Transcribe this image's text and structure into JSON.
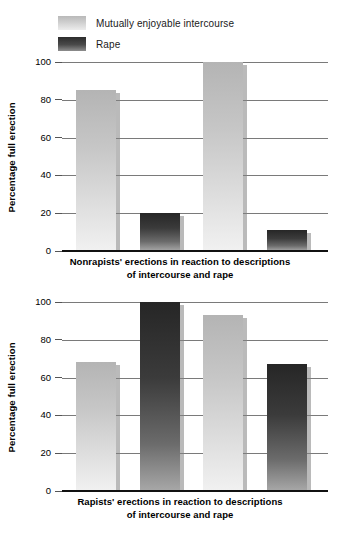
{
  "legend": {
    "items": [
      {
        "label": "Mutually enjoyable intercourse",
        "swatch": "light-gradient-swatch",
        "color": "#cfcfcf"
      },
      {
        "label": "Rape",
        "swatch": "dark-gradient-swatch",
        "color": "#3b3b3b"
      }
    ]
  },
  "chart_data": [
    {
      "id": "nonrapists",
      "type": "bar",
      "title": "",
      "caption_line1": "Nonrapists' erections in reaction to descriptions",
      "caption_line2": "of intercourse and rape",
      "xlabel": "",
      "ylabel": "Percentage full erection",
      "ylim": [
        0,
        100
      ],
      "yticks": [
        0,
        20,
        40,
        60,
        80,
        100
      ],
      "ytick_labels": [
        "0",
        "20",
        "40",
        "60",
        "80",
        "100"
      ],
      "grid": true,
      "legend_position": "above-figure",
      "categories": [
        "Mutually enjoyable intercourse",
        "Rape",
        "Mutually enjoyable intercourse",
        "Rape"
      ],
      "series": [
        {
          "name": "Mutually enjoyable intercourse",
          "color": "#cfcfcf",
          "values": [
            85,
            null,
            100,
            null
          ]
        },
        {
          "name": "Rape",
          "color": "#3b3b3b",
          "values": [
            null,
            20,
            null,
            11
          ]
        }
      ],
      "bars": [
        {
          "group": "Mutually enjoyable intercourse",
          "value": 85,
          "style": "light"
        },
        {
          "group": "Rape",
          "value": 20,
          "style": "dark"
        },
        {
          "group": "Mutually enjoyable intercourse",
          "value": 100,
          "style": "light"
        },
        {
          "group": "Rape",
          "value": 11,
          "style": "dark"
        }
      ]
    },
    {
      "id": "rapists",
      "type": "bar",
      "title": "",
      "caption_line1": "Rapists' erections in reaction to descriptions",
      "caption_line2": "of intercourse and rape",
      "xlabel": "",
      "ylabel": "Percentage full erection",
      "ylim": [
        0,
        100
      ],
      "yticks": [
        0,
        20,
        40,
        60,
        80,
        100
      ],
      "ytick_labels": [
        "0",
        "20",
        "40",
        "60",
        "80",
        "100"
      ],
      "grid": true,
      "legend_position": "above-figure",
      "categories": [
        "Mutually enjoyable intercourse",
        "Rape",
        "Mutually enjoyable intercourse",
        "Rape"
      ],
      "series": [
        {
          "name": "Mutually enjoyable intercourse",
          "color": "#cfcfcf",
          "values": [
            68,
            null,
            93,
            null
          ]
        },
        {
          "name": "Rape",
          "color": "#3b3b3b",
          "values": [
            null,
            100,
            null,
            67
          ]
        }
      ],
      "bars": [
        {
          "group": "Mutually enjoyable intercourse",
          "value": 68,
          "style": "light"
        },
        {
          "group": "Rape",
          "value": 100,
          "style": "dark"
        },
        {
          "group": "Mutually enjoyable intercourse",
          "value": 93,
          "style": "light"
        },
        {
          "group": "Rape",
          "value": 67,
          "style": "dark"
        }
      ]
    }
  ]
}
